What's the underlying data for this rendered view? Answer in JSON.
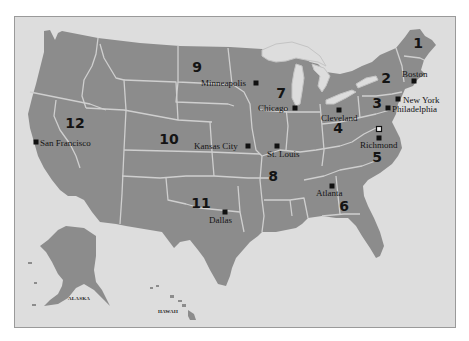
{
  "map": {
    "title": "Federal Reserve Districts",
    "colors": {
      "land": "#8c8c8c",
      "water": "#dddddd",
      "border": "#cfcfcf",
      "text": "#141414"
    },
    "districts": [
      {
        "number": "1",
        "x": 418,
        "y": 48
      },
      {
        "number": "2",
        "x": 386,
        "y": 83
      },
      {
        "number": "3",
        "x": 377,
        "y": 108
      },
      {
        "number": "4",
        "x": 338,
        "y": 133
      },
      {
        "number": "5",
        "x": 377,
        "y": 162
      },
      {
        "number": "6",
        "x": 344,
        "y": 211
      },
      {
        "number": "7",
        "x": 281,
        "y": 98
      },
      {
        "number": "8",
        "x": 273,
        "y": 181
      },
      {
        "number": "9",
        "x": 197,
        "y": 72
      },
      {
        "number": "10",
        "x": 169,
        "y": 144
      },
      {
        "number": "11",
        "x": 201,
        "y": 208
      },
      {
        "number": "12",
        "x": 75,
        "y": 128
      }
    ],
    "cities": [
      {
        "name": "Boston",
        "label_x": 402,
        "label_y": 77,
        "marker_x": 414,
        "marker_y": 81,
        "anchor": "start"
      },
      {
        "name": "New York",
        "label_x": 403,
        "label_y": 103,
        "marker_x": 398,
        "marker_y": 99,
        "anchor": "start"
      },
      {
        "name": "Philadelphia",
        "label_x": 392,
        "label_y": 112,
        "marker_x": 388,
        "marker_y": 108,
        "anchor": "start"
      },
      {
        "name": "Cleveland",
        "label_x": 321,
        "label_y": 121,
        "marker_x": 339,
        "marker_y": 110,
        "anchor": "start"
      },
      {
        "name": "Richmond",
        "label_x": 360,
        "label_y": 148,
        "marker_x": 379,
        "marker_y": 138,
        "anchor": "start"
      },
      {
        "name": "Atlanta",
        "label_x": 316,
        "label_y": 196,
        "marker_x": 332,
        "marker_y": 186,
        "anchor": "start"
      },
      {
        "name": "Chicago",
        "label_x": 258,
        "label_y": 111,
        "marker_x": 295,
        "marker_y": 108,
        "anchor": "start"
      },
      {
        "name": "St. Louis",
        "label_x": 267,
        "label_y": 157,
        "marker_x": 277,
        "marker_y": 146,
        "anchor": "start"
      },
      {
        "name": "Minneapolis",
        "label_x": 201,
        "label_y": 86,
        "marker_x": 256,
        "marker_y": 83,
        "anchor": "start"
      },
      {
        "name": "Kansas City",
        "label_x": 194,
        "label_y": 149,
        "marker_x": 248,
        "marker_y": 146,
        "anchor": "start"
      },
      {
        "name": "Dallas",
        "label_x": 209,
        "label_y": 223,
        "marker_x": 225,
        "marker_y": 212,
        "anchor": "start"
      },
      {
        "name": "San Francisco",
        "label_x": 40,
        "label_y": 146,
        "marker_x": 36,
        "marker_y": 142,
        "anchor": "start"
      }
    ],
    "dc_marker": {
      "x": 379,
      "y": 129
    },
    "insets": [
      {
        "name": "ALASKA",
        "x": 68,
        "y": 300
      },
      {
        "name": "HAWAII",
        "x": 158,
        "y": 313
      }
    ]
  }
}
